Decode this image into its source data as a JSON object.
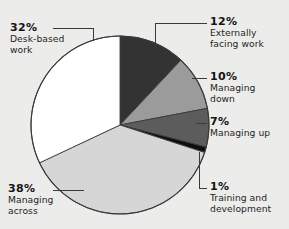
{
  "background_color": "#ececea",
  "chart_data": {
    "type": "pie",
    "title": "",
    "subtitle": "",
    "xlabel": "",
    "ylabel": "",
    "legend_position": "callout-labels",
    "grid": false,
    "total": 100,
    "units": "%",
    "categories": [
      "Externally facing work",
      "Managing down",
      "Managing up",
      "Training and development",
      "Managing across",
      "Desk-based work"
    ],
    "values": [
      12,
      10,
      7,
      1,
      38,
      32
    ],
    "slices": [
      {
        "label": "Externally facing work",
        "label_line1": "Externally",
        "label_line2": "facing work",
        "percent_text": "12%",
        "value": 12,
        "color": "#333333",
        "start_angle": 0,
        "end_angle": 43.2
      },
      {
        "label": "Managing down",
        "label_line1": "Managing",
        "label_line2": "down",
        "percent_text": "10%",
        "value": 10,
        "color": "#9b9b9b",
        "start_angle": 43.2,
        "end_angle": 79.2
      },
      {
        "label": "Managing up",
        "label_line1": "Managing up",
        "label_line2": "",
        "percent_text": "7%",
        "value": 7,
        "color": "#5c5c5c",
        "start_angle": 79.2,
        "end_angle": 104.4
      },
      {
        "label": "Training and development",
        "label_line1": "Training and",
        "label_line2": "development",
        "percent_text": "1%",
        "value": 1,
        "color": "#0d0d0d",
        "start_angle": 104.4,
        "end_angle": 108.0
      },
      {
        "label": "Managing across",
        "label_line1": "Managing",
        "label_line2": "across",
        "percent_text": "38%",
        "value": 38,
        "color": "#d6d6d6",
        "start_angle": 108.0,
        "end_angle": 244.8
      },
      {
        "label": "Desk-based work",
        "label_line1": "Desk-based",
        "label_line2": "work",
        "percent_text": "32%",
        "value": 32,
        "color": "#ffffff",
        "start_angle": 244.8,
        "end_angle": 360.0
      }
    ]
  },
  "labels": {
    "desk_based": {
      "percent": "32%",
      "line1": "Desk-based",
      "line2": "work"
    },
    "managing_across": {
      "percent": "38%",
      "line1": "Managing",
      "line2": "across"
    },
    "externally_facing": {
      "percent": "12%",
      "line1": "Externally",
      "line2": "facing work"
    },
    "managing_down": {
      "percent": "10%",
      "line1": "Managing",
      "line2": "down"
    },
    "managing_up": {
      "percent": "7%",
      "line1": "Managing up",
      "line2": ""
    },
    "training_development": {
      "percent": "1%",
      "line1": "Training and",
      "line2": "development"
    }
  }
}
